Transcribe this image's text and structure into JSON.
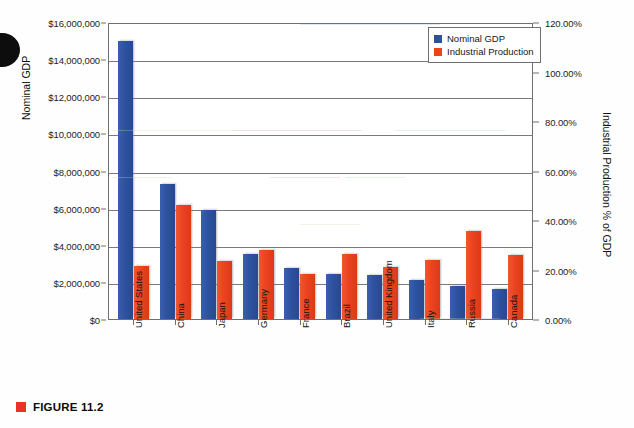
{
  "figure": {
    "caption_label": "FIGURE 11.2",
    "caption_marker": "red-square-marker"
  },
  "legend": {
    "position": "top-right",
    "items": [
      {
        "label": "Nominal GDP",
        "color": "#2d52a0"
      },
      {
        "label": "Industrial Production",
        "color": "#ea431f"
      }
    ]
  },
  "axes": {
    "left": {
      "title": "Nominal GDP",
      "ticks": [
        "$0",
        "$2,000,000",
        "$4,000,000",
        "$6,000,000",
        "$8,000,000",
        "$10,000,000",
        "$12,000,000",
        "$14,000,000",
        "$16,000,000"
      ],
      "min": 0,
      "max": 16000000,
      "step": 2000000
    },
    "right": {
      "title": "Industrial Production % of GDP",
      "ticks": [
        "0.00%",
        "20.00%",
        "40.00%",
        "60.00%",
        "80.00%",
        "100.00%",
        "120.00%"
      ],
      "min": 0,
      "max": 120,
      "step": 20
    }
  },
  "chart_data": {
    "type": "bar",
    "title": "",
    "xlabel": "",
    "ylabel": "Nominal GDP",
    "y2label": "Industrial Production % of GDP",
    "ylim": [
      0,
      16000000
    ],
    "y2lim": [
      0,
      120
    ],
    "grid": true,
    "legend_position": "top-right",
    "categories": [
      "United States",
      "China",
      "Japan",
      "Germany",
      "France",
      "Brazil",
      "United Kingdom",
      "Italy",
      "Russia",
      "Canada"
    ],
    "series": [
      {
        "name": "Nominal GDP",
        "color": "#2d52a0",
        "axis": "left",
        "unit": "USD millions",
        "values": [
          15000000,
          7250000,
          5850000,
          3500000,
          2750000,
          2400000,
          2350000,
          2100000,
          1800000,
          1600000
        ]
      },
      {
        "name": "Industrial Production",
        "color": "#ea431f",
        "axis": "right",
        "unit": "percent of GDP",
        "values_left_scale": [
          2850000,
          6150000,
          3150000,
          3700000,
          2400000,
          3500000,
          2800000,
          3200000,
          4750000,
          3450000
        ],
        "values": [
          21.4,
          46.1,
          23.6,
          27.8,
          18.0,
          26.3,
          21.0,
          24.0,
          35.6,
          25.9
        ]
      }
    ]
  },
  "colors": {
    "series_blue": "#2d52a0",
    "series_red": "#ea431f",
    "axis_line": "#6f6f6f",
    "gridline": "#7a7a7a",
    "caption_marker": "#ee3124",
    "page_background": "#fefefe"
  }
}
